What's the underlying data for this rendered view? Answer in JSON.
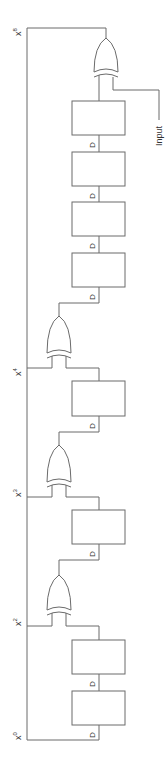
{
  "diagram": {
    "type": "linear-feedback-shift-register",
    "orientation": "rotated-90-ccw",
    "colors": {
      "line": "#6b6b6b",
      "text": "#333333",
      "background": "#ffffff"
    },
    "taps": [
      {
        "id": "x8",
        "base": "x",
        "exp": "8"
      },
      {
        "id": "x4",
        "base": "x",
        "exp": "4"
      },
      {
        "id": "x3",
        "base": "x",
        "exp": "3"
      },
      {
        "id": "x2",
        "base": "x",
        "exp": "2"
      },
      {
        "id": "x0",
        "base": "x",
        "exp": "0"
      }
    ],
    "registers": [
      {
        "index": 1,
        "label": "D"
      },
      {
        "index": 2,
        "label": "D"
      },
      {
        "index": 3,
        "label": "D"
      },
      {
        "index": 4,
        "label": "D"
      },
      {
        "index": 5,
        "label": "D"
      },
      {
        "index": 6,
        "label": "D"
      },
      {
        "index": 7,
        "label": "D"
      },
      {
        "index": 8,
        "label": "D"
      }
    ],
    "gates": [
      {
        "type": "XOR",
        "tap": "x8"
      },
      {
        "type": "XOR",
        "tap": "x4"
      },
      {
        "type": "XOR",
        "tap": "x3"
      },
      {
        "type": "XOR",
        "tap": "x2"
      }
    ],
    "input_label": "Input"
  }
}
